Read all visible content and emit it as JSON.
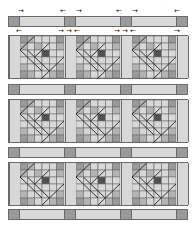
{
  "diagram": {
    "type": "quilt-assembly",
    "layout": {
      "block_rows": 3,
      "block_cols": 3,
      "sashing": true,
      "cornerstones": true
    },
    "colors": {
      "light": "#d8d8d8",
      "medium": "#b4b4b4",
      "dark": "#9a9a9a",
      "center": "#505050",
      "line": "#6a6a6a",
      "seam": "#1a1a1a"
    },
    "pressing_arrows": {
      "row_top": [
        "→",
        "←",
        "→",
        "←",
        "→",
        "←"
      ],
      "row_second": [
        "←",
        "→",
        "→",
        "←",
        "→",
        "→",
        "←",
        "→"
      ]
    },
    "block_grid": 6,
    "block_cells": [
      [
        "D",
        "M",
        "L",
        "L",
        "L",
        "D"
      ],
      [
        "M",
        "L",
        "M",
        "L",
        "L",
        "M"
      ],
      [
        "L",
        "L",
        "L",
        "C",
        "L",
        "L"
      ],
      [
        "L",
        "L",
        "L",
        "L",
        "L",
        "L"
      ],
      [
        "M",
        "L",
        "L",
        "L",
        "L",
        "M"
      ],
      [
        "D",
        "M",
        "L",
        "L",
        "M",
        "D"
      ]
    ]
  }
}
